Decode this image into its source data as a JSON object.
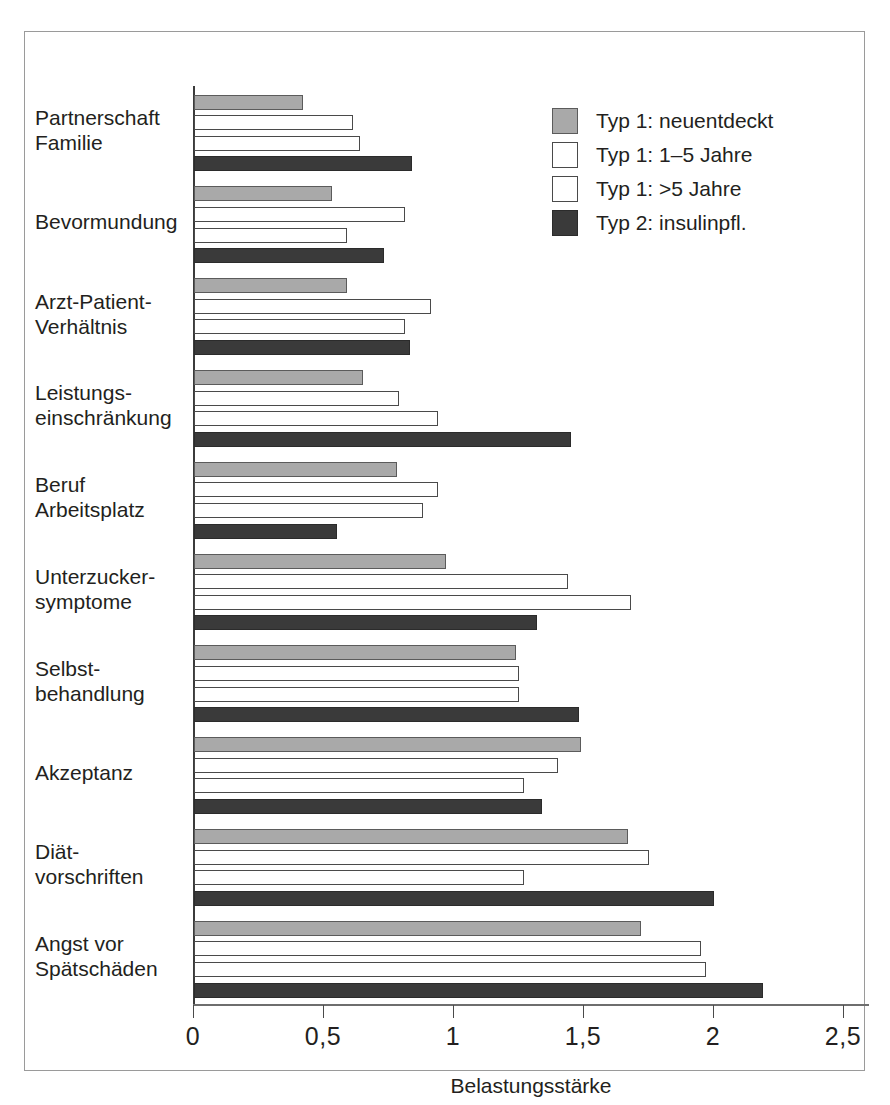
{
  "chart_data": {
    "type": "bar",
    "orientation": "horizontal",
    "title": "",
    "xlabel": "Belastungsstärke",
    "ylabel": "",
    "xlim": [
      0,
      2.5
    ],
    "xticks": [
      0,
      0.5,
      1,
      1.5,
      2,
      2.5
    ],
    "xticklabels": [
      "0",
      "0,5",
      "1",
      "1,5",
      "2",
      "2,5"
    ],
    "grid": false,
    "legend_position": "top-right",
    "categories": [
      "Partnerschaft\nFamilie",
      "Bevormundung",
      "Arzt-Patient-\nVerhältnis",
      "Leistungs-\neinschränkung",
      "Beruf\nArbeitsplatz",
      "Unterzucker-\nsymptome",
      "Selbst-\nbehandlung",
      "Akzeptanz",
      "Diät-\nvorschriften",
      "Angst vor\nSpätschäden"
    ],
    "series": [
      {
        "name": "Typ 1: neuentdeckt",
        "color": "#a9a9a9",
        "values": [
          0.42,
          0.53,
          0.59,
          0.65,
          0.78,
          0.97,
          1.24,
          1.49,
          1.67,
          1.72
        ]
      },
      {
        "name": "Typ 1: 1–5 Jahre",
        "color": "#ffffff",
        "values": [
          0.61,
          0.81,
          0.91,
          0.79,
          0.94,
          1.44,
          1.25,
          1.4,
          1.75,
          1.95
        ]
      },
      {
        "name": "Typ 1: >5 Jahre",
        "color": "#ffffff",
        "values": [
          0.64,
          0.59,
          0.81,
          0.94,
          0.88,
          1.68,
          1.25,
          1.27,
          1.27,
          1.97
        ]
      },
      {
        "name": "Typ 2: insulinpfl.",
        "color": "#3a3a3a",
        "values": [
          0.84,
          0.73,
          0.83,
          1.45,
          0.55,
          1.32,
          1.48,
          1.34,
          2.0,
          2.19
        ]
      }
    ]
  },
  "legend": {
    "items": [
      {
        "label": "Typ 1: neuentdeckt"
      },
      {
        "label": "Typ 1: 1–5 Jahre"
      },
      {
        "label": "Typ 1: >5 Jahre"
      },
      {
        "label": "Typ 2: insulinpfl."
      }
    ]
  },
  "axis": {
    "x_title": "Belastungsstärke",
    "tick_labels": [
      "0",
      "0,5",
      "1",
      "1,5",
      "2",
      "2,5"
    ]
  }
}
